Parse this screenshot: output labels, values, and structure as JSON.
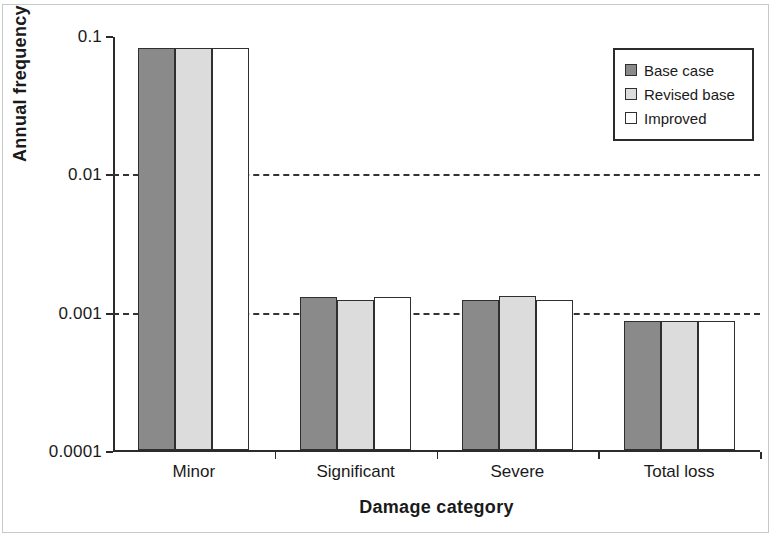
{
  "chart_data": {
    "type": "bar",
    "title": "",
    "xlabel": "Damage category",
    "ylabel": "Annual frequency",
    "yscale": "log",
    "ylim": [
      0.0001,
      0.1
    ],
    "ytick_labels": [
      "0.1",
      "0.01",
      "0.001",
      "0.0001"
    ],
    "ytick_values": [
      0.1,
      0.01,
      0.001,
      0.0001
    ],
    "grid": "horizontal-dashed-at-0.01-and-0.001",
    "legend_position": "top-right",
    "categories": [
      "Minor",
      "Significant",
      "Severe",
      "Total loss"
    ],
    "series": [
      {
        "name": "Base case",
        "color": "#8a8a8a",
        "values": [
          0.08,
          0.00128,
          0.00122,
          0.00085
        ]
      },
      {
        "name": "Revised base",
        "color": "#dcdcdc",
        "values": [
          0.08,
          0.00122,
          0.0013,
          0.00085
        ]
      },
      {
        "name": "Improved",
        "color": "#ffffff",
        "values": [
          0.08,
          0.00128,
          0.00122,
          0.00085
        ]
      }
    ]
  },
  "legend": {
    "items": [
      {
        "label": "Base case",
        "swatch": "dark-gray-swatch-icon",
        "color": "#8a8a8a"
      },
      {
        "label": "Revised base",
        "swatch": "light-gray-swatch-icon",
        "color": "#dcdcdc"
      },
      {
        "label": "Improved",
        "swatch": "white-swatch-icon",
        "color": "#ffffff"
      }
    ]
  },
  "axes": {
    "y_title": "Annual frequency",
    "x_title": "Damage category",
    "y_ticks": [
      "0.1",
      "0.01",
      "0.001",
      "0.0001"
    ],
    "x_ticks": [
      "Minor",
      "Significant",
      "Severe",
      "Total loss"
    ]
  },
  "colors": {
    "axis": "#2b2b2b",
    "grid": "#333333",
    "bar_border": "#2f2f2f",
    "series_1": "#8a8a8a",
    "series_2": "#dcdcdc",
    "series_3": "#ffffff",
    "frame": "#c9c9c9",
    "background": "#ffffff"
  }
}
